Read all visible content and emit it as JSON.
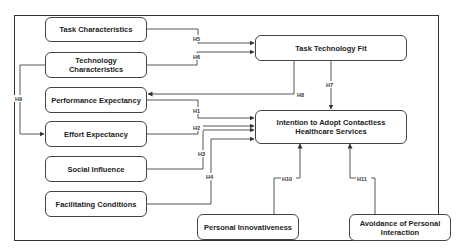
{
  "diagram": {
    "nodes": {
      "task_characteristics": "Task Characteristics",
      "technology_characteristics": "Technology Characteristics",
      "performance_expectancy": "Performance Expectancy",
      "effort_expectancy": "Effort Expectancy",
      "social_influence": "Social Influence",
      "facilitating_conditions": "Facilitating Conditions",
      "task_technology_fit": "Task Technology Fit",
      "intention": "Intention to Adopt Contactless Healthcare Services",
      "personal_innovativeness": "Personal Innovativeness",
      "avoidance": "Avoidance of Personal Interaction"
    },
    "edges": [
      {
        "id": "H1",
        "from": "Performance Expectancy",
        "to": "Intention to Adopt Contactless Healthcare Services"
      },
      {
        "id": "H2",
        "from": "Effort Expectancy",
        "to": "Intention to Adopt Contactless Healthcare Services"
      },
      {
        "id": "H3",
        "from": "Social Influence",
        "to": "Intention to Adopt Contactless Healthcare Services"
      },
      {
        "id": "H4",
        "from": "Facilitating Conditions",
        "to": "Intention to Adopt Contactless Healthcare Services"
      },
      {
        "id": "H5",
        "from": "Task Characteristics",
        "to": "Task Technology Fit"
      },
      {
        "id": "H6",
        "from": "Technology Characteristics",
        "to": "Task Technology Fit"
      },
      {
        "id": "H7",
        "from": "Task Technology Fit",
        "to": "Intention to Adopt Contactless Healthcare Services"
      },
      {
        "id": "H8",
        "from": "Task Technology Fit",
        "to": "Performance Expectancy"
      },
      {
        "id": "H9",
        "from": "Technology Characteristics",
        "to": "Effort Expectancy"
      },
      {
        "id": "H10",
        "from": "Personal Innovativeness",
        "to": "Intention to Adopt Contactless Healthcare Services"
      },
      {
        "id": "H11",
        "from": "Avoidance of Personal Interaction",
        "to": "Intention to Adopt Contactless Healthcare Services"
      }
    ],
    "labels": {
      "h1": "H1",
      "h2": "H2",
      "h3": "H3",
      "h4": "H4",
      "h5": "H5",
      "h6": "H6",
      "h7": "H7",
      "h8": "H8",
      "h9": "H9",
      "h10": "H10",
      "h11": "H11"
    },
    "colors": {
      "stroke": "#444444",
      "text": "#222222",
      "background": "#ffffff"
    }
  }
}
